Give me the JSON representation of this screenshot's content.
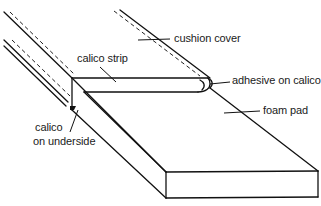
{
  "diagram": {
    "type": "technical-illustration",
    "labels": {
      "cushion_cover": "cushion cover",
      "calico_strip": "calico strip",
      "adhesive_on_calico": "adhesive on calico",
      "foam_pad": "foam pad",
      "calico_on_underside_line1": "calico",
      "calico_on_underside_line2": "on underside"
    },
    "colors": {
      "line": "#111111",
      "background": "#ffffff",
      "text": "#1a1a1a"
    }
  }
}
